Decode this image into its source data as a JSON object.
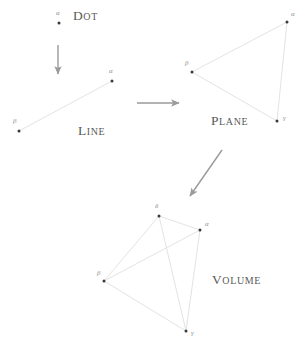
{
  "canvas": {
    "width": 303,
    "height": 348,
    "background": "#ffffff"
  },
  "style": {
    "edge_color": "#e3e3e3",
    "vertex_color": "#3a3a3a",
    "arrow_color": "#9a9a9a",
    "label_color": "#5a5a5a",
    "vertex_label_color": "#8e8e8e"
  },
  "stages": [
    {
      "id": "dot",
      "name": "Dot",
      "label": {
        "first": "D",
        "rest": "OT",
        "x": 73,
        "y": 9
      },
      "vertices": [
        {
          "id": "alpha",
          "glyph": "α",
          "x": 59,
          "y": 23,
          "label_x": 56,
          "label_y": 10
        }
      ],
      "edges": []
    },
    {
      "id": "line",
      "name": "Line",
      "label": {
        "first": "L",
        "rest": "INE",
        "x": 78,
        "y": 124
      },
      "vertices": [
        {
          "id": "beta",
          "glyph": "β",
          "x": 19,
          "y": 131,
          "label_x": 13,
          "label_y": 118
        },
        {
          "id": "alpha",
          "glyph": "α",
          "x": 112,
          "y": 81,
          "label_x": 109,
          "label_y": 68
        }
      ],
      "edges": [
        [
          "beta",
          "alpha"
        ]
      ]
    },
    {
      "id": "plane",
      "name": "Plane",
      "label": {
        "first": "P",
        "rest": "LANE",
        "x": 211,
        "y": 114
      },
      "vertices": [
        {
          "id": "beta",
          "glyph": "β",
          "x": 192,
          "y": 72,
          "label_x": 185,
          "label_y": 60
        },
        {
          "id": "alpha",
          "glyph": "α",
          "x": 287,
          "y": 22,
          "label_x": 291,
          "label_y": 11
        },
        {
          "id": "gamma",
          "glyph": "γ",
          "x": 277,
          "y": 121,
          "label_x": 283,
          "label_y": 115
        }
      ],
      "edges": [
        [
          "beta",
          "alpha"
        ],
        [
          "alpha",
          "gamma"
        ],
        [
          "gamma",
          "beta"
        ]
      ]
    },
    {
      "id": "volume",
      "name": "Volume",
      "label": {
        "first": "V",
        "rest": "OLUME",
        "x": 212,
        "y": 273
      },
      "vertices": [
        {
          "id": "delta",
          "glyph": "δ",
          "x": 159,
          "y": 216,
          "label_x": 155,
          "label_y": 203
        },
        {
          "id": "alpha",
          "glyph": "α",
          "x": 200,
          "y": 230,
          "label_x": 205,
          "label_y": 221
        },
        {
          "id": "beta",
          "glyph": "β",
          "x": 104,
          "y": 281,
          "label_x": 97,
          "label_y": 270
        },
        {
          "id": "gamma",
          "glyph": "γ",
          "x": 186,
          "y": 331,
          "label_x": 191,
          "label_y": 330
        }
      ],
      "edges": [
        [
          "delta",
          "alpha"
        ],
        [
          "delta",
          "beta"
        ],
        [
          "delta",
          "gamma"
        ],
        [
          "beta",
          "alpha"
        ],
        [
          "beta",
          "gamma"
        ],
        [
          "alpha",
          "gamma"
        ]
      ]
    }
  ],
  "arrows": [
    {
      "id": "dot-to-line",
      "x1": 58,
      "y1": 45,
      "x2": 58,
      "y2": 74
    },
    {
      "id": "line-to-plane",
      "x1": 137,
      "y1": 103,
      "x2": 179,
      "y2": 103
    },
    {
      "id": "plane-to-volume",
      "x1": 222,
      "y1": 150,
      "x2": 190,
      "y2": 196
    }
  ]
}
